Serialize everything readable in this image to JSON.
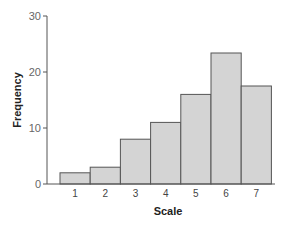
{
  "chart_data": {
    "type": "bar",
    "title": "",
    "xlabel": "Scale",
    "ylabel": "Frequency",
    "categories": [
      "1",
      "2",
      "3",
      "4",
      "5",
      "6",
      "7"
    ],
    "values": [
      2,
      3,
      8,
      11,
      16,
      23.4,
      17.5
    ],
    "ylim": [
      0,
      30
    ],
    "yticks": [
      "0",
      "10",
      "20",
      "30"
    ],
    "grid": false,
    "legend": "none",
    "bar_color": "#d4d4d4",
    "bar_edge_color": "#555555",
    "bar_gap": 0
  }
}
